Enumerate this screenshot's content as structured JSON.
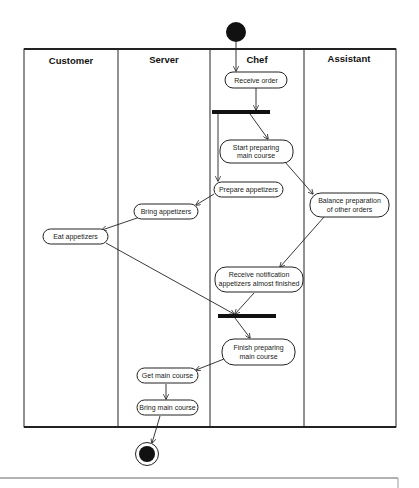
{
  "diagram": {
    "type": "UML activity diagram with swimlanes",
    "lanes": [
      {
        "id": "customer",
        "label": "Customer"
      },
      {
        "id": "server",
        "label": "Server"
      },
      {
        "id": "chef",
        "label": "Chef"
      },
      {
        "id": "assistant",
        "label": "Assistant"
      }
    ],
    "nodes": {
      "start": {
        "kind": "initial",
        "lane": "chef"
      },
      "receive_order": {
        "kind": "action",
        "lane": "chef",
        "lines": [
          "Receive order"
        ]
      },
      "fork": {
        "kind": "fork",
        "lane": "chef"
      },
      "start_preparing": {
        "kind": "action",
        "lane": "chef",
        "lines": [
          "Start preparing",
          "main course"
        ]
      },
      "prepare_appetizers": {
        "kind": "action",
        "lane": "chef",
        "lines": [
          "Prepare appetizers"
        ]
      },
      "balance_preparation": {
        "kind": "action",
        "lane": "assistant",
        "lines": [
          "Balance preparation",
          "of other orders"
        ]
      },
      "bring_appetizers": {
        "kind": "action",
        "lane": "server",
        "lines": [
          "Bring appetizers"
        ]
      },
      "eat_appetizers": {
        "kind": "action",
        "lane": "customer",
        "lines": [
          "Eat appetizers"
        ]
      },
      "receive_notification": {
        "kind": "action",
        "lane": "chef",
        "lines": [
          "Receive notification",
          "appetizers almost finished"
        ]
      },
      "join": {
        "kind": "join",
        "lane": "chef"
      },
      "finish_preparing": {
        "kind": "action",
        "lane": "chef",
        "lines": [
          "Finish preparing",
          "main course"
        ]
      },
      "get_main_course": {
        "kind": "action",
        "lane": "server",
        "lines": [
          "Get main course"
        ]
      },
      "bring_main_course": {
        "kind": "action",
        "lane": "server",
        "lines": [
          "Bring main course"
        ]
      },
      "end": {
        "kind": "final"
      }
    },
    "edges": [
      [
        "start",
        "receive_order"
      ],
      [
        "receive_order",
        "fork"
      ],
      [
        "fork",
        "start_preparing"
      ],
      [
        "fork",
        "prepare_appetizers"
      ],
      [
        "start_preparing",
        "balance_preparation"
      ],
      [
        "prepare_appetizers",
        "bring_appetizers"
      ],
      [
        "bring_appetizers",
        "eat_appetizers"
      ],
      [
        "balance_preparation",
        "receive_notification"
      ],
      [
        "eat_appetizers",
        "join"
      ],
      [
        "receive_notification",
        "join"
      ],
      [
        "join",
        "finish_preparing"
      ],
      [
        "finish_preparing",
        "get_main_course"
      ],
      [
        "get_main_course",
        "bring_main_course"
      ],
      [
        "bring_main_course",
        "end"
      ]
    ]
  }
}
